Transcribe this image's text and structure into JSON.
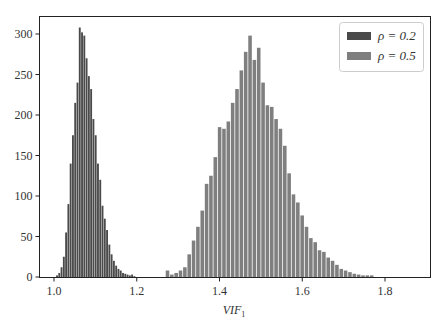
{
  "chart_data": {
    "type": "bar",
    "title": "",
    "xlabel": "VIF",
    "xlabel_subscript": "1",
    "ylabel": "",
    "xlim": [
      0.965,
      1.91
    ],
    "ylim": [
      0,
      335
    ],
    "x_ticks": [
      1.0,
      1.2,
      1.4,
      1.6,
      1.8
    ],
    "x_tick_labels": [
      "1.0",
      "1.2",
      "1.4",
      "1.6",
      "1.8"
    ],
    "y_ticks": [
      0,
      50,
      100,
      150,
      200,
      250,
      300
    ],
    "y_tick_labels": [
      "0",
      "50",
      "100",
      "150",
      "200",
      "250",
      "300"
    ],
    "grid": false,
    "legend_position": "upper right",
    "series": [
      {
        "name": "ρ = 0.2",
        "color": "#4a4a4a",
        "bin_start": 1.005,
        "bin_width": 0.0055,
        "values": [
          2,
          5,
          12,
          25,
          55,
          90,
          140,
          175,
          215,
          240,
          308,
          302,
          298,
          270,
          248,
          232,
          195,
          175,
          140,
          120,
          88,
          72,
          58,
          40,
          28,
          20,
          14,
          10,
          8,
          5,
          4,
          3,
          2,
          3,
          1
        ]
      },
      {
        "name": "ρ = 0.5",
        "color": "#7f7f7f",
        "bin_start": 1.27,
        "bin_width": 0.0105,
        "values": [
          8,
          3,
          5,
          8,
          12,
          28,
          45,
          62,
          82,
          115,
          125,
          148,
          185,
          183,
          192,
          215,
          232,
          255,
          278,
          298,
          268,
          283,
          240,
          212,
          210,
          195,
          183,
          162,
          128,
          102,
          92,
          76,
          62,
          48,
          43,
          33,
          31,
          24,
          20,
          15,
          10,
          8,
          6,
          4,
          3,
          2,
          2,
          2
        ]
      }
    ]
  },
  "legend": {
    "items": [
      {
        "label": "ρ = 0.2",
        "color": "#4a4a4a"
      },
      {
        "label": "ρ = 0.5",
        "color": "#7f7f7f"
      }
    ]
  }
}
